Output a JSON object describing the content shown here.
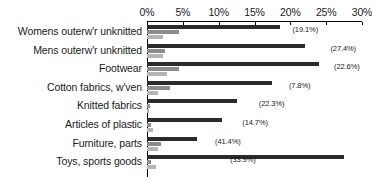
{
  "chart_data": {
    "type": "bar",
    "orientation": "horizontal",
    "title": "",
    "subtitle": "",
    "xlabel": "",
    "ylabel": "",
    "xlim": [
      0,
      30
    ],
    "grid": false,
    "legend": "none",
    "axis_position": "top",
    "tick_labels": [
      "0%",
      "5%",
      "10%",
      "15%",
      "20%",
      "25%",
      "30%"
    ],
    "tick_values": [
      0,
      5,
      10,
      15,
      20,
      25,
      30
    ],
    "categories": [
      "Womens outerw'r unknitted",
      "Mens outerw'r unknitted",
      "Footwear",
      "Cotton fabrics, w'ven",
      "Knitted fabrics",
      "Articles of plastic",
      "Furniture, parts",
      "Toys, sports goods"
    ],
    "series": [
      {
        "name": "series-1",
        "color": "#2b2b2b",
        "values": [
          18.5,
          22.0,
          24.0,
          17.5,
          12.5,
          10.5,
          7.0,
          27.5
        ]
      },
      {
        "name": "series-2",
        "color": "#8c8c8c",
        "values": [
          4.5,
          2.5,
          4.5,
          3.2,
          0.4,
          0.5,
          2.0,
          0.6
        ]
      },
      {
        "name": "series-3",
        "color": "#b5b5b5",
        "values": [
          2.2,
          2.2,
          2.8,
          1.5,
          0.3,
          0.9,
          1.5,
          1.2
        ]
      }
    ],
    "annotations": [
      "(19.1%)",
      "(27.4%)",
      "(22.6%)",
      "(7.8%)",
      "(22.3%)",
      "(14.7%)",
      "(41.4%)",
      "(33.9%)"
    ],
    "annotation_x": [
      20.3,
      25.6,
      26.1,
      19.8,
      15.6,
      13.3,
      9.5,
      11.6
    ]
  }
}
